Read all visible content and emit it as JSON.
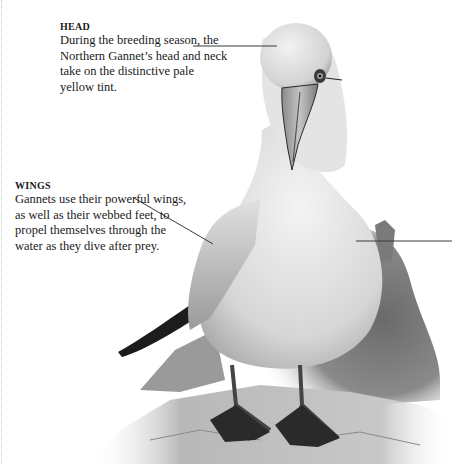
{
  "callouts": {
    "head": {
      "label": "HEAD",
      "body": "During the breeding season, the Northern Gannet’s head and neck take on the distinctive pale yellow tint."
    },
    "wings": {
      "label": "WINGS",
      "body": "Gannets use their powerful wings, as well as their webbed feet, to propel themselves through the water as they dive after prey."
    }
  },
  "illustration": {
    "subject": "Northern Gannet standing on rock",
    "style": "grayscale"
  },
  "colors": {
    "leader_line": "#3a3a3a",
    "text": "#1a1a1a",
    "background": "#ffffff"
  }
}
